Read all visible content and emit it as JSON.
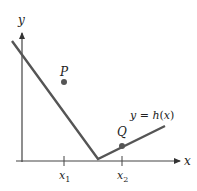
{
  "diagram": {
    "axes": {
      "x_label": "x",
      "y_label": "y"
    },
    "ticks": {
      "x1": {
        "main": "x",
        "sub": "1"
      },
      "x2": {
        "main": "x",
        "sub": "2"
      }
    },
    "curve": {
      "label_prefix": "y = ",
      "label_func": "h",
      "label_open": "(",
      "label_var": "x",
      "label_close": ")",
      "color": "#555555"
    },
    "points": [
      {
        "name": "P",
        "color": "#555555"
      },
      {
        "name": "Q",
        "color": "#555555"
      }
    ]
  }
}
